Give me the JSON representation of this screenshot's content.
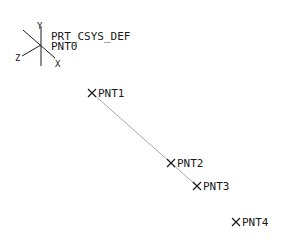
{
  "csys": {
    "name": "PRT_CSYS_DEF",
    "origin": [
      41,
      45
    ],
    "axes": {
      "x": "X",
      "y": "Y",
      "z": "Z"
    },
    "origin_point": "PNT0"
  },
  "points": [
    {
      "name": "PNT1",
      "x": 92,
      "y": 93
    },
    {
      "name": "PNT2",
      "x": 171,
      "y": 163
    },
    {
      "name": "PNT3",
      "x": 197,
      "y": 186
    },
    {
      "name": "PNT4",
      "x": 236,
      "y": 222
    }
  ],
  "line": {
    "from": "PNT1",
    "to": "PNT3",
    "color": "#a8a8a8"
  },
  "colors": {
    "ink": "#1a1a1a",
    "line": "#a8a8a8",
    "background": "#ffffff"
  }
}
